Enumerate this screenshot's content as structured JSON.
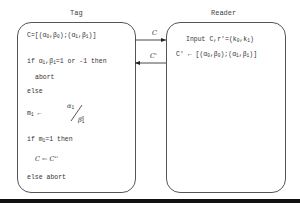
{
  "tag": {
    "title": "Tag",
    "lines": {
      "c_def_prefix": "C=[(α",
      "c_def_sub0": "0",
      "c_def_mid1": ",β",
      "c_def_sub0b": "0",
      "c_def_mid2": ");(α",
      "c_def_sub1": "1",
      "c_def_mid3": ",β",
      "c_def_sub1b": "1",
      "c_def_end": ")]",
      "if_prefix": "if α",
      "if_sub1": "1",
      "if_mid": ",β",
      "if_sub2": "1",
      "if_end": "=1 or -1 then",
      "abort": "abort",
      "else": "else",
      "m_prefix": "m",
      "m_sub": "1",
      "m_arrow": " ← ",
      "frac_num": "α",
      "frac_num_sub": "1",
      "frac_den": "β",
      "frac_den_sub": "1",
      "frac_den_sup": "x",
      "if_m_prefix": "if m",
      "if_m_sub": "1",
      "if_m_end": "=1 then",
      "assign": "C ← C''",
      "else_abort": "else abort"
    }
  },
  "reader": {
    "title": "Reader",
    "lines": {
      "input_prefix": "Input C,r'=(k",
      "input_sub0": "0",
      "input_mid": ",k",
      "input_sub1": "1",
      "input_end": ")",
      "cprime_prefix": "C' ← [(α",
      "cprime_sub0": "0",
      "cprime_mid1": ",β",
      "cprime_sub0b": "0",
      "cprime_mid2": ");(α",
      "cprime_sub1": "1",
      "cprime_mid3": ",β",
      "cprime_sub1b": "1",
      "cprime_end": ")]"
    }
  },
  "arrows": [
    {
      "label": "C",
      "direction": "tag-to-reader"
    },
    {
      "label": "C'",
      "direction": "reader-to-tag"
    }
  ]
}
